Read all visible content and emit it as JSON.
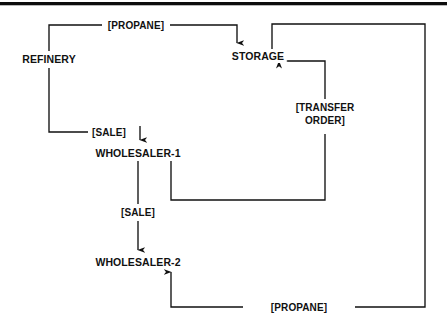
{
  "diagram": {
    "line_color": "#111111",
    "text_color": "#111111",
    "background": "#ffffff",
    "top_rule_color": "#0d0d0d",
    "nodes": [
      {
        "id": "refinery",
        "label": "REFINERY",
        "x": 49,
        "y": 59
      },
      {
        "id": "storage",
        "label": "STORAGE",
        "x": 258,
        "y": 56
      },
      {
        "id": "wholesaler1",
        "label": "WHOLESALER-1",
        "x": 138,
        "y": 153
      },
      {
        "id": "wholesaler2",
        "label": "WHOLESALER-2",
        "x": 138,
        "y": 262
      }
    ],
    "edge_labels": [
      {
        "id": "propane-top",
        "text": "[PROPANE]",
        "x": 135,
        "y": 25
      },
      {
        "id": "sale-refinery",
        "text": "[SALE]",
        "x": 108,
        "y": 132
      },
      {
        "id": "transfer-order",
        "line1": "[TRANSFER",
        "line2": "ORDER]",
        "x": 325,
        "y": 116
      },
      {
        "id": "sale-wholesaler",
        "text": "[SALE]",
        "x": 138,
        "y": 212
      },
      {
        "id": "propane-bottom",
        "text": "[PROPANE]",
        "x": 299,
        "y": 307
      }
    ],
    "edges": [
      {
        "id": "refinery-to-storage",
        "from": "refinery",
        "to": "storage",
        "label": "[PROPANE]"
      },
      {
        "id": "refinery-to-wholesaler1",
        "from": "refinery",
        "to": "wholesaler1",
        "label": "[SALE]"
      },
      {
        "id": "wholesaler1-to-wholesaler2",
        "from": "wholesaler1",
        "to": "wholesaler2",
        "label": "[SALE]"
      },
      {
        "id": "wholesaler1-to-storage",
        "from": "wholesaler1",
        "to": "storage",
        "label": "[TRANSFER ORDER]"
      },
      {
        "id": "storage-to-wholesaler2",
        "from": "storage",
        "to": "wholesaler2",
        "label": "[PROPANE]"
      }
    ]
  }
}
